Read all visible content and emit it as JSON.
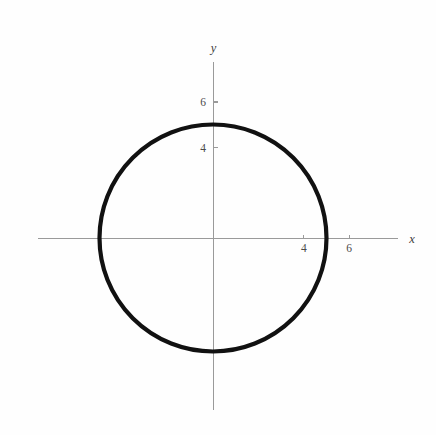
{
  "figure": {
    "background_color": "#fefefe",
    "width": 436,
    "height": 435,
    "curve_color": "#111111",
    "axis_color": "#9a9a9a",
    "label_color": "#4a4a4a"
  },
  "axes": {
    "x_axis_label": "x",
    "y_axis_label": "y",
    "x_ticks_visible": [
      "4",
      "6"
    ],
    "y_ticks_visible": [
      "4",
      "6"
    ],
    "origin_px": {
      "x": 213,
      "y": 238
    },
    "unit_px": 22.7,
    "x_axis_span_px": {
      "start": 38,
      "end": 398
    },
    "y_axis_span_px": {
      "start": 62,
      "end": 410
    }
  },
  "chart_data": {
    "type": "line",
    "title": "",
    "subtitle": "",
    "xlabel": "x",
    "ylabel": "y",
    "grid": false,
    "legend": null,
    "legend_position": "none",
    "xlim": [
      -8.0,
      8.2
    ],
    "ylim": [
      -7.6,
      7.8
    ],
    "xticks": [
      4,
      6
    ],
    "xticklabels": [
      "4",
      "6"
    ],
    "yticks": [
      4,
      6
    ],
    "yticklabels": [
      "4",
      "6"
    ],
    "series": [
      {
        "name": "circle",
        "shape": "circle",
        "equation": "x^2 + y^2 = 25",
        "center": [
          0,
          0
        ],
        "radius": 5,
        "color": "#111111",
        "linewidth": 4.2,
        "points": [
          [
            5.0,
            0.0
          ],
          [
            4.83,
            1.29
          ],
          [
            4.33,
            2.5
          ],
          [
            3.54,
            3.54
          ],
          [
            2.5,
            4.33
          ],
          [
            1.29,
            4.83
          ],
          [
            0.0,
            5.0
          ],
          [
            -1.29,
            4.83
          ],
          [
            -2.5,
            4.33
          ],
          [
            -3.54,
            3.54
          ],
          [
            -4.33,
            2.5
          ],
          [
            -4.83,
            1.29
          ],
          [
            -5.0,
            0.0
          ],
          [
            -4.83,
            -1.29
          ],
          [
            -4.33,
            -2.5
          ],
          [
            -3.54,
            -3.54
          ],
          [
            -2.5,
            -4.33
          ],
          [
            -1.29,
            -4.83
          ],
          [
            0.0,
            -5.0
          ],
          [
            1.29,
            -4.83
          ],
          [
            2.5,
            -4.33
          ],
          [
            3.54,
            -3.54
          ],
          [
            4.33,
            -2.5
          ],
          [
            4.83,
            -1.29
          ],
          [
            5.0,
            0.0
          ]
        ],
        "x_intercepts": [
          -5,
          5
        ],
        "y_intercepts": [
          -5,
          5
        ]
      }
    ],
    "annotations": []
  }
}
